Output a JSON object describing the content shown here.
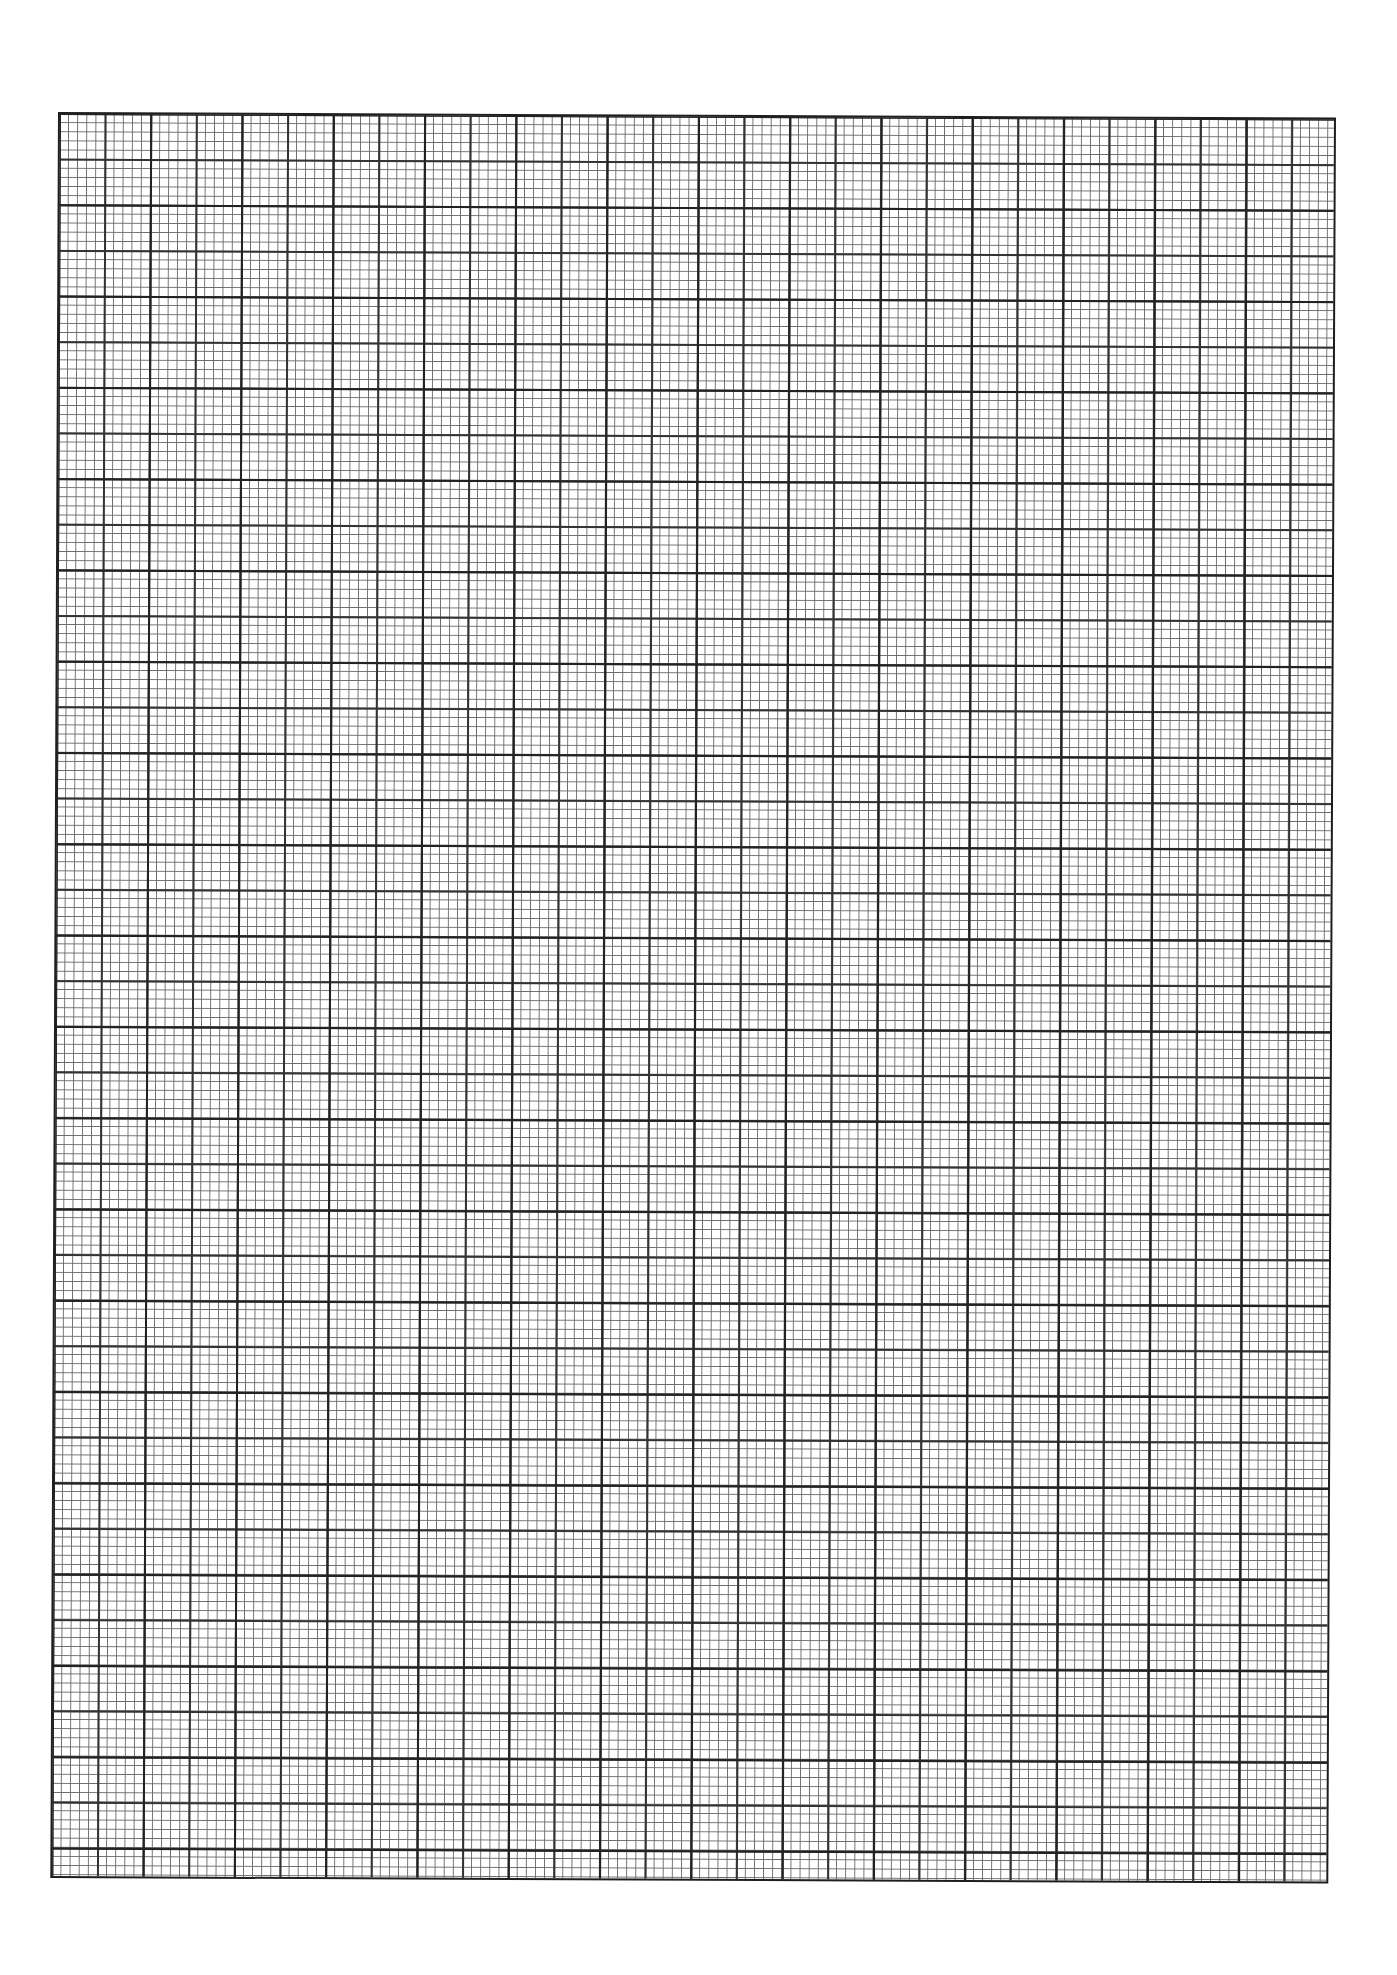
{
  "page": {
    "type": "graph-paper",
    "grid": {
      "minor_cell_px": 9.13,
      "medium_line_every_cells": 5,
      "major_line_every_cells": 10,
      "major_columns": 14,
      "major_rows": 19.3,
      "line_color": "#222222",
      "paper_color": "#ffffff"
    },
    "caption": ""
  }
}
